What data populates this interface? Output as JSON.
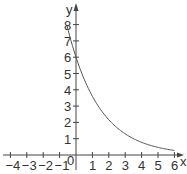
{
  "chart_data": {
    "type": "line",
    "title": "",
    "xlabel": "x",
    "ylabel": "y",
    "origin_label": "0",
    "xlim": [
      -4.3,
      6.3
    ],
    "ylim": [
      0,
      8.8
    ],
    "x_ticks": [
      -4,
      -3,
      -2,
      -1,
      1,
      2,
      3,
      4,
      5,
      6
    ],
    "x_tick_labels": [
      "−4",
      "−3",
      "−2",
      "−1",
      "1",
      "2",
      "3",
      "4",
      "5",
      "6"
    ],
    "y_ticks": [
      1,
      2,
      3,
      4,
      5,
      6,
      7,
      8
    ],
    "y_tick_labels": [
      "1",
      "2",
      "3",
      "4",
      "5",
      "6",
      "7",
      "8"
    ],
    "grid": false,
    "legend": null,
    "series": [
      {
        "name": "y = 6(0.6)^x",
        "x": [
          -0.55,
          0,
          1,
          2,
          3,
          4,
          5,
          6
        ],
        "y": [
          7.9,
          6,
          3.6,
          2.16,
          1.3,
          0.78,
          0.47,
          0.28
        ]
      }
    ]
  },
  "colors": {
    "axis": "#444444",
    "curve": "#555555",
    "text": "#333333",
    "background": "#ffffff"
  }
}
